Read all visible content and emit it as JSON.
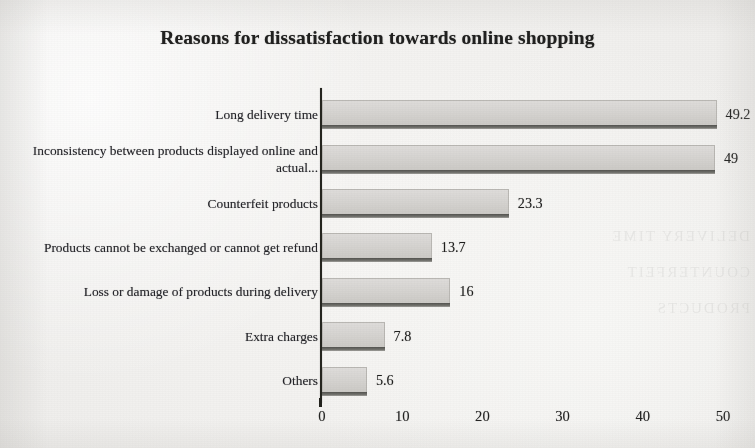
{
  "chart_data": {
    "type": "bar",
    "orientation": "horizontal",
    "title": "Reasons for dissatisfaction towards online shopping",
    "xlabel": "",
    "ylabel": "",
    "xlim": [
      0,
      50
    ],
    "xticks": [
      "0",
      "10",
      "20",
      "30",
      "40",
      "50"
    ],
    "grid": false,
    "legend": false,
    "categories": [
      "Long delivery time",
      "Inconsistency between products displayed online and actual...",
      "Counterfeit products",
      "Products cannot be exchanged or cannot get refund",
      "Loss or damage of products during delivery",
      "Extra charges",
      "Others"
    ],
    "values": [
      49.2,
      49,
      23.3,
      13.7,
      16,
      7.8,
      5.6
    ],
    "value_labels": [
      "49.2",
      "49",
      "23.3",
      "13.7",
      "16",
      "7.8",
      "5.6"
    ],
    "bar_color": "#d6d4d1",
    "bar_edge_color": "#b9b7b3",
    "axis_color": "#25251f",
    "text_color": "#23231f"
  },
  "artifacts": {
    "bleed_through_line_1": "DELIVERY TIME",
    "bleed_through_line_2": "COUNTERFEIT",
    "bleed_through_line_3": "PRODUCTS"
  }
}
